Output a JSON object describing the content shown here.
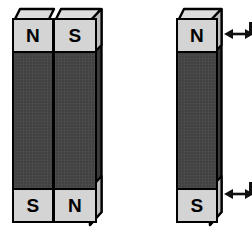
{
  "diagram": {
    "background_color": "#ffffff",
    "outline_color": "#000000",
    "pole_face_color": "#d4d4d4",
    "body_color": "#454545",
    "side_face_color": "#3a3a3a",
    "arrow_color": "#111111"
  },
  "left_group": {
    "name": "magnet-pair",
    "description": "Two bar magnets standing side by side, touching",
    "magnets": [
      {
        "id": "left-magnet",
        "top_pole": "N",
        "bottom_pole": "S"
      },
      {
        "id": "right-magnet",
        "top_pole": "S",
        "bottom_pole": "N"
      }
    ]
  },
  "right_group": {
    "name": "single-magnet",
    "description": "One bar magnet with motion arrows",
    "magnet": {
      "id": "single-magnet",
      "top_pole": "N",
      "bottom_pole": "S"
    },
    "arrows": [
      {
        "id": "top-arrow",
        "type": "double-headed-horizontal"
      },
      {
        "id": "bottom-arrow",
        "type": "double-headed-horizontal"
      }
    ]
  }
}
